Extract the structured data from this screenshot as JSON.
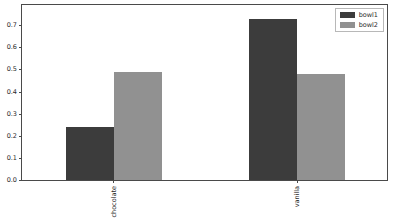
{
  "chart_data": {
    "type": "bar",
    "title": "",
    "xlabel": "",
    "ylabel": "",
    "categories": [
      "chocolate",
      "vanilla"
    ],
    "series": [
      {
        "name": "bowl1",
        "color": "#3c3c3c",
        "values": [
          0.24,
          0.73
        ]
      },
      {
        "name": "bowl2",
        "color": "#919191",
        "values": [
          0.49,
          0.48
        ]
      }
    ],
    "ylim": [
      0.0,
      0.8
    ],
    "yticks": [
      "0.0",
      "0.1",
      "0.2",
      "0.3",
      "0.4",
      "0.5",
      "0.6",
      "0.7"
    ],
    "ytick_values": [
      0.0,
      0.1,
      0.2,
      0.3,
      0.4,
      0.5,
      0.6,
      0.7
    ],
    "grid": false,
    "legend_position": "upper right",
    "xtick_rotation": 90
  },
  "legend": {
    "entries": [
      {
        "label": "bowl1"
      },
      {
        "label": "bowl2"
      }
    ]
  }
}
